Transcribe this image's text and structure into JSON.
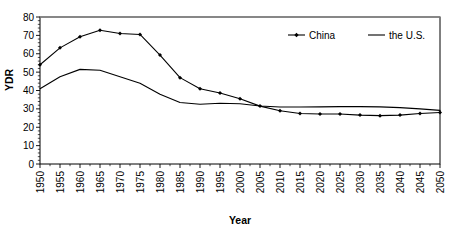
{
  "chart_data": {
    "type": "line",
    "title": "",
    "xlabel": "Year",
    "ylabel": "YDR",
    "xlim": [
      1950,
      2050
    ],
    "ylim": [
      0,
      80
    ],
    "ytick_step": 10,
    "xtick_step": 5,
    "grid": false,
    "legend_position": "top-right",
    "x": [
      1950,
      1955,
      1960,
      1965,
      1970,
      1975,
      1980,
      1985,
      1990,
      1995,
      2000,
      2005,
      2010,
      2015,
      2020,
      2025,
      2030,
      2035,
      2040,
      2045,
      2050
    ],
    "xticklabels": [
      "1950",
      "1955",
      "1960",
      "1965",
      "1970",
      "1975",
      "1980",
      "1985",
      "1990",
      "1995",
      "2000",
      "2005",
      "2010",
      "2015",
      "2020",
      "2025",
      "2030",
      "2035",
      "2040",
      "2045",
      "2050"
    ],
    "yticklabels": [
      "0",
      "10",
      "20",
      "30",
      "40",
      "50",
      "60",
      "70",
      "80"
    ],
    "yticks": [
      0,
      10,
      20,
      30,
      40,
      50,
      60,
      70,
      80
    ],
    "series": [
      {
        "name": "China",
        "marker": "diamond",
        "color": "#000000",
        "values": [
          54.0,
          63.2,
          69.2,
          72.8,
          71.0,
          70.5,
          59.3,
          47.0,
          41.0,
          38.6,
          35.5,
          31.5,
          29.0,
          27.5,
          27.2,
          27.2,
          26.6,
          26.3,
          26.6,
          27.5,
          28.0
        ]
      },
      {
        "name": "the U.S.",
        "marker": "none",
        "color": "#000000",
        "values": [
          41.0,
          47.5,
          51.5,
          51.0,
          47.5,
          44.0,
          38.0,
          33.5,
          32.5,
          33.1,
          32.8,
          31.6,
          31.0,
          31.0,
          31.1,
          31.2,
          31.2,
          31.1,
          30.7,
          30.0,
          29.2
        ]
      }
    ]
  },
  "legend": {
    "items": [
      {
        "label": "China"
      },
      {
        "label": "the U.S."
      }
    ]
  },
  "axes": {
    "x_title": "Year",
    "y_title": "YDR"
  }
}
